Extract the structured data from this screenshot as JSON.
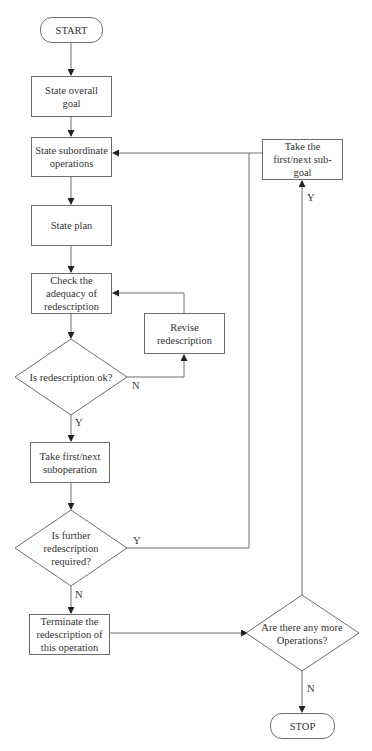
{
  "diagram": {
    "type": "flowchart",
    "nodes": {
      "start": "START",
      "state_goal": "State overall goal",
      "state_subops": "State subordinate operations",
      "state_plan": "State plan",
      "check_adequacy": "Check the adequacy of redescription",
      "revise": "Revise redescription",
      "is_ok": "Is redescription ok?",
      "take_subop": "Take first/next suboperation",
      "further": "Is further redescription required?",
      "terminate": "Terminate the redescription of this operation",
      "more_ops": "Are there any more Operations?",
      "take_subgoal": "Take the first/next sub-goal",
      "stop": "STOP"
    },
    "edge_labels": {
      "is_ok_no": "N",
      "is_ok_yes": "Y",
      "further_yes": "Y",
      "further_no": "N",
      "more_ops_yes": "Y",
      "more_ops_no": "N"
    },
    "edges": [
      [
        "start",
        "state_goal"
      ],
      [
        "state_goal",
        "state_subops"
      ],
      [
        "state_subops",
        "state_plan"
      ],
      [
        "state_plan",
        "check_adequacy"
      ],
      [
        "check_adequacy",
        "is_ok"
      ],
      [
        "is_ok",
        "revise",
        "N"
      ],
      [
        "revise",
        "check_adequacy"
      ],
      [
        "is_ok",
        "take_subop",
        "Y"
      ],
      [
        "take_subop",
        "further"
      ],
      [
        "further",
        "state_subops",
        "Y"
      ],
      [
        "further",
        "terminate",
        "N"
      ],
      [
        "terminate",
        "more_ops"
      ],
      [
        "more_ops",
        "take_subgoal",
        "Y"
      ],
      [
        "take_subgoal",
        "state_subops"
      ],
      [
        "more_ops",
        "stop",
        "N"
      ]
    ]
  }
}
